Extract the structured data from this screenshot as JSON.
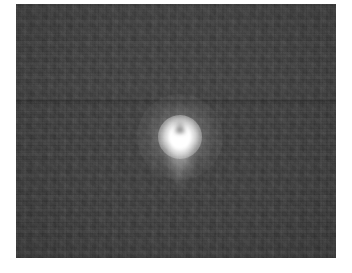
{
  "image": {
    "title": "Bright point source on dark field",
    "kind": "grayscale-photograph",
    "caption": "",
    "canvas": {
      "width": 352,
      "height": 273
    },
    "background_color": "#ffffff"
  },
  "frame": {
    "name": "photo-frame",
    "left": 16,
    "top": 4,
    "width": 320,
    "height": 254,
    "field_color": "#3a3a3a",
    "field_color_upper": "#3d3d3d",
    "field_color_lower": "#3a3a3a",
    "border_color": "#ffffff"
  },
  "seam": {
    "name": "horizontal-seam",
    "y": 99,
    "thickness": 3,
    "color": "#2e2e2e"
  },
  "source": {
    "name": "bright-point-source",
    "center_x": 180,
    "center_y": 137,
    "core_color": "#ffffff",
    "glow_color": "#ffffff",
    "core_width": 22,
    "core_height": 24,
    "glow_diameter": 44,
    "halo_diameter": 86,
    "notch": {
      "name": "core-top-notch",
      "offset_y": -20,
      "width": 12,
      "height": 16
    },
    "tail": {
      "name": "downward-tail",
      "offset_y": 6,
      "width": 17,
      "height": 54
    },
    "rays": [
      {
        "angle": 160,
        "length": 40,
        "width": 6
      },
      {
        "angle": 196,
        "length": 44,
        "width": 7
      },
      {
        "angle": 178,
        "length": 50,
        "width": 8
      },
      {
        "angle": 214,
        "length": 30,
        "width": 5
      },
      {
        "angle": 146,
        "length": 28,
        "width": 5
      },
      {
        "angle": 8,
        "length": 22,
        "width": 5
      },
      {
        "angle": 348,
        "length": 20,
        "width": 5
      },
      {
        "angle": 94,
        "length": 26,
        "width": 5
      },
      {
        "angle": 266,
        "length": 26,
        "width": 5
      }
    ]
  }
}
